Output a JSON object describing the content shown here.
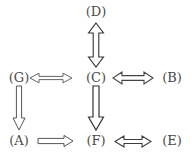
{
  "diagram": {
    "type": "node-arrow-graph",
    "background_color": "#ffffff",
    "node_color": "#4a4a4a",
    "arrow_color": "#333333",
    "nodes": [
      {
        "id": "D",
        "label": "(D)",
        "x": 96,
        "y": 12,
        "row": "top",
        "col": "center"
      },
      {
        "id": "G",
        "label": "(G)",
        "x": 18,
        "y": 78,
        "row": "middle",
        "col": "left"
      },
      {
        "id": "C",
        "label": "(C)",
        "x": 96,
        "y": 78,
        "row": "middle",
        "col": "center"
      },
      {
        "id": "B",
        "label": "(B)",
        "x": 172,
        "y": 78,
        "row": "middle",
        "col": "right"
      },
      {
        "id": "A",
        "label": "(A)",
        "x": 18,
        "y": 141,
        "row": "bottom",
        "col": "left"
      },
      {
        "id": "F",
        "label": "(F)",
        "x": 96,
        "y": 141,
        "row": "bottom",
        "col": "center"
      },
      {
        "id": "E",
        "label": "(E)",
        "x": 172,
        "y": 141,
        "row": "bottom",
        "col": "right"
      }
    ],
    "edges": [
      {
        "id": "D-C",
        "from": "D",
        "to": "C",
        "direction": "bidirectional",
        "orientation": "vertical",
        "weight": "heavy",
        "style": "hollow-double-arrow"
      },
      {
        "id": "G-C",
        "from": "G",
        "to": "C",
        "direction": "bidirectional",
        "orientation": "horizontal",
        "weight": "light",
        "style": "hollow-double-arrow"
      },
      {
        "id": "C-B",
        "from": "C",
        "to": "B",
        "direction": "bidirectional",
        "orientation": "horizontal",
        "weight": "medium",
        "style": "hollow-double-arrow"
      },
      {
        "id": "G-A",
        "from": "G",
        "to": "A",
        "direction": "forward",
        "orientation": "vertical",
        "weight": "medium",
        "style": "hollow-arrow"
      },
      {
        "id": "C-F",
        "from": "C",
        "to": "F",
        "direction": "forward",
        "orientation": "vertical",
        "weight": "heavy",
        "style": "hollow-arrow"
      },
      {
        "id": "A-F",
        "from": "A",
        "to": "F",
        "direction": "forward",
        "orientation": "horizontal",
        "weight": "medium",
        "style": "hollow-arrow"
      },
      {
        "id": "F-E",
        "from": "F",
        "to": "E",
        "direction": "bidirectional",
        "orientation": "horizontal",
        "weight": "medium",
        "style": "hollow-double-arrow"
      }
    ]
  }
}
